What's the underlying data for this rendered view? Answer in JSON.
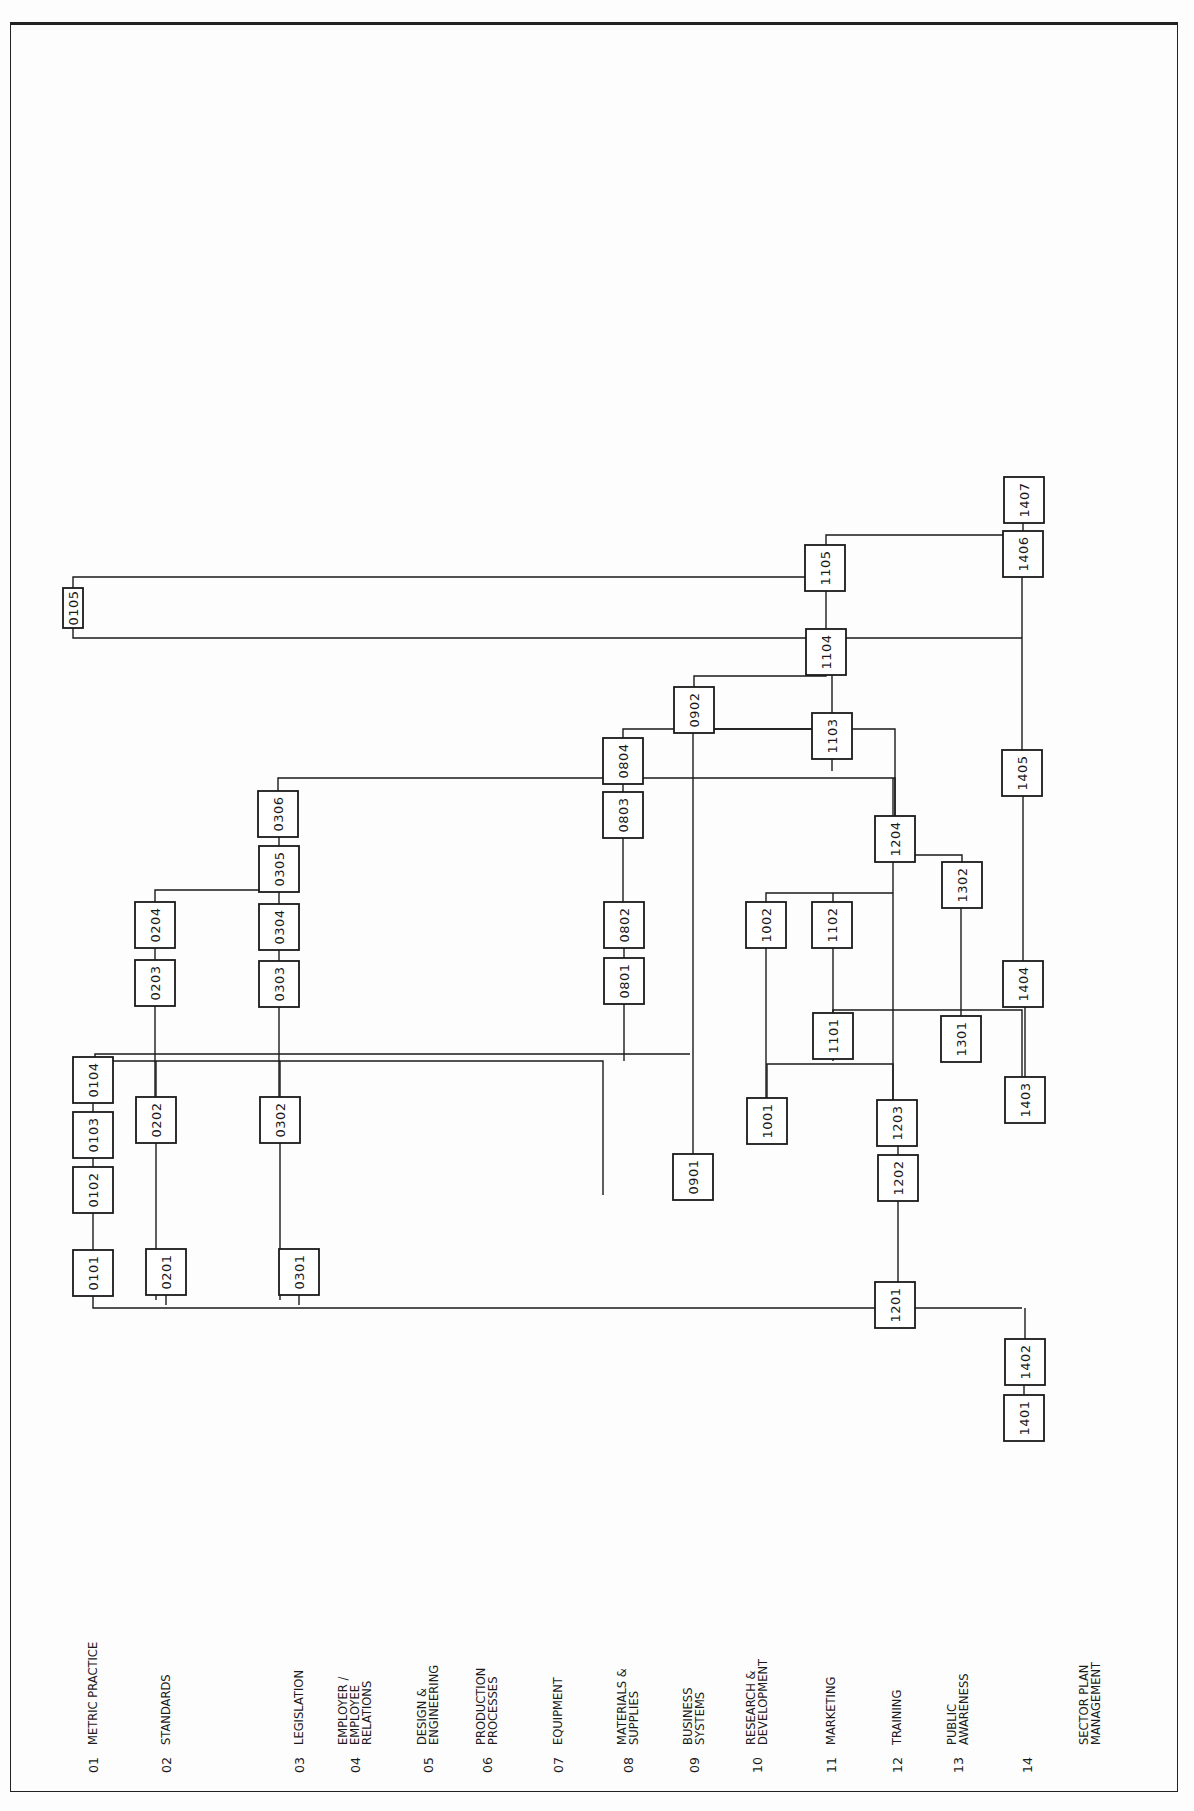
{
  "diagram": {
    "type": "precedence-network",
    "orientation": "rotated-90-ccw",
    "colors": {
      "ink": "#1a1a1a",
      "paper": "#fdfdfd"
    },
    "lanes": [
      {
        "num": "01",
        "name": [
          "METRIC PRACTICE"
        ],
        "x": 93
      },
      {
        "num": "02",
        "name": [
          "STANDARDS"
        ],
        "x": 166
      },
      {
        "num": "03",
        "name": [
          "LEGISLATION"
        ],
        "x": 299
      },
      {
        "num": "04",
        "name": [
          "EMPLOYER /",
          "EMPLOYEE",
          "RELATIONS"
        ],
        "x": 355
      },
      {
        "num": "05",
        "name": [
          "DESIGN &",
          "ENGINEERING"
        ],
        "x": 428
      },
      {
        "num": "06",
        "name": [
          "PRODUCTION",
          "PROCESSES"
        ],
        "x": 487
      },
      {
        "num": "07",
        "name": [
          "EQUIPMENT"
        ],
        "x": 558
      },
      {
        "num": "08",
        "name": [
          "MATERIALS &",
          "SUPPLIES"
        ],
        "x": 628
      },
      {
        "num": "09",
        "name": [
          "BUSINESS",
          "SYSTEMS"
        ],
        "x": 694
      },
      {
        "num": "10",
        "name": [
          "RESEARCH &",
          "DEVELOPMENT"
        ],
        "x": 757
      },
      {
        "num": "11",
        "name": [
          "MARKETING"
        ],
        "x": 831
      },
      {
        "num": "12",
        "name": [
          "TRAINING"
        ],
        "x": 897
      },
      {
        "num": "13",
        "name": [
          "PUBLIC",
          "AWARENESS"
        ],
        "x": 958
      },
      {
        "num": "14",
        "name": [
          ""
        ],
        "x": 1027
      },
      {
        "num": "",
        "name": [
          "SECTOR PLAN",
          "MANAGEMENT"
        ],
        "x": 1090
      }
    ],
    "nodes": [
      {
        "id": "0101",
        "x": 93,
        "y": 1273
      },
      {
        "id": "0102",
        "x": 93,
        "y": 1190
      },
      {
        "id": "0103",
        "x": 93,
        "y": 1135
      },
      {
        "id": "0104",
        "x": 93,
        "y": 1080
      },
      {
        "id": "0105",
        "x": 73,
        "y": 608,
        "w": 20,
        "h": 40
      },
      {
        "id": "0201",
        "x": 166,
        "y": 1272
      },
      {
        "id": "0202",
        "x": 156,
        "y": 1120
      },
      {
        "id": "0203",
        "x": 155,
        "y": 983
      },
      {
        "id": "0204",
        "x": 155,
        "y": 925
      },
      {
        "id": "0301",
        "x": 299,
        "y": 1272
      },
      {
        "id": "0302",
        "x": 280,
        "y": 1120
      },
      {
        "id": "0303",
        "x": 279,
        "y": 984
      },
      {
        "id": "0304",
        "x": 279,
        "y": 927
      },
      {
        "id": "0305",
        "x": 279,
        "y": 869
      },
      {
        "id": "0306",
        "x": 278,
        "y": 814
      },
      {
        "id": "0801",
        "x": 624,
        "y": 981
      },
      {
        "id": "0802",
        "x": 624,
        "y": 925
      },
      {
        "id": "0803",
        "x": 623,
        "y": 815
      },
      {
        "id": "0804",
        "x": 623,
        "y": 761
      },
      {
        "id": "0901",
        "x": 693,
        "y": 1177
      },
      {
        "id": "0902",
        "x": 694,
        "y": 710
      },
      {
        "id": "1001",
        "x": 767,
        "y": 1121
      },
      {
        "id": "1002",
        "x": 766,
        "y": 925
      },
      {
        "id": "1101",
        "x": 833,
        "y": 1036
      },
      {
        "id": "1102",
        "x": 832,
        "y": 925
      },
      {
        "id": "1103",
        "x": 832,
        "y": 736
      },
      {
        "id": "1104",
        "x": 826,
        "y": 652
      },
      {
        "id": "1105",
        "x": 825,
        "y": 568
      },
      {
        "id": "1201",
        "x": 895,
        "y": 1305
      },
      {
        "id": "1202",
        "x": 898,
        "y": 1178
      },
      {
        "id": "1203",
        "x": 897,
        "y": 1123
      },
      {
        "id": "1204",
        "x": 895,
        "y": 839
      },
      {
        "id": "1301",
        "x": 961,
        "y": 1039
      },
      {
        "id": "1302",
        "x": 962,
        "y": 885
      },
      {
        "id": "1401",
        "x": 1024,
        "y": 1418
      },
      {
        "id": "1402",
        "x": 1025,
        "y": 1362
      },
      {
        "id": "1403",
        "x": 1025,
        "y": 1100
      },
      {
        "id": "1404",
        "x": 1023,
        "y": 984
      },
      {
        "id": "1405",
        "x": 1022,
        "y": 773
      },
      {
        "id": "1406",
        "x": 1023,
        "y": 554
      },
      {
        "id": "1407",
        "x": 1024,
        "y": 500
      }
    ],
    "connectors": [
      "M93,1251 V1212",
      "M93,1168 V1157",
      "M93,1113 V1102",
      "M93,1058 V1061 H603 V1195",
      "M93,1295 V1308 H1022",
      "M166,1250 V1305",
      "M299,1250 V1305",
      "M156,1098 V1061",
      "M156,1142 V1300",
      "M280,1098 V1061",
      "M280,1142 V1300",
      "M95,1058 V1054 H690",
      "M155,1005 V1097",
      "M155,961 V947",
      "M155,903 V890 H279 V891",
      "M279,962 V949",
      "M279,1006 V1098",
      "M279,905 V891",
      "M279,847 V836",
      "M278,792 V778 H895 V817",
      "M624,959 V947",
      "M624,1003 V1061",
      "M623,903 V837",
      "M623,793 V783",
      "M623,739 V729 H895 V817",
      "M693,1155 V732",
      "M694,688 V676 H826 V674",
      "M694,732 V729 H826 V714",
      "M767,1099 V1064 H893 V1101",
      "M766,947 V1099",
      "M766,903 V893 H893",
      "M833,1014 V947",
      "M833,1058 V1061",
      "M833,903 V893",
      "M833,1014 V1010 H1022 V1078",
      "M961,1017 V907",
      "M962,863 V855 H895",
      "M893,1101 V861",
      "M895,1327 V1308",
      "M898,1156 V1145",
      "M898,1200 V1283",
      "M893,817 V778",
      "M832,714 V674",
      "M832,758 V771",
      "M826,630 V590",
      "M826,546 V535 H1023 V532",
      "M73,588 V577 H826 V590",
      "M73,628 V638 H1022",
      "M1024,1396 V1384",
      "M1025,1340 V1308",
      "M1025,1078 V1006",
      "M1023,962 V795",
      "M1022,751 V576",
      "M1023,532 V522"
    ]
  }
}
